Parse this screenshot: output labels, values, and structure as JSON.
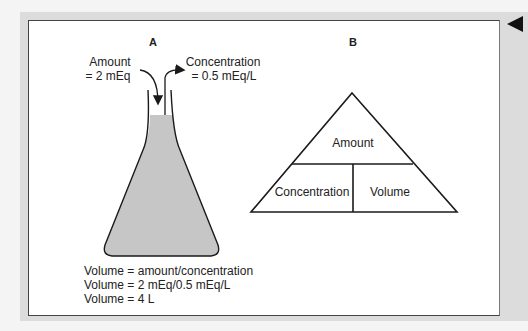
{
  "panel_a": {
    "label": "A",
    "amount_label": "Amount",
    "amount_value": "= 2 mEq",
    "concentration_label": "Concentration",
    "concentration_value": "= 0.5 mEq/L",
    "equations": [
      "Volume = amount/concentration",
      "Volume = 2 mEq/0.5 mEq/L",
      "Volume = 4 L"
    ]
  },
  "panel_b": {
    "label": "B",
    "top": "Amount",
    "bottom_left": "Concentration",
    "bottom_right": "Volume"
  },
  "nav": {
    "back_icon": "triangle-left"
  },
  "colors": {
    "liquid": "#c6c6c6",
    "frame": "#dcdcdc",
    "line": "#1a1a1a"
  }
}
